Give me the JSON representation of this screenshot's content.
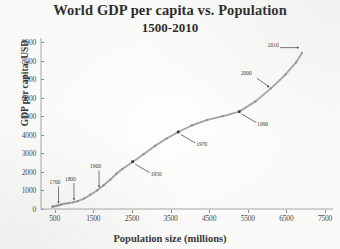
{
  "chart_data": {
    "type": "line",
    "title": "World GDP per capita vs. Population",
    "subtitle": "1500-2010",
    "xlabel": "Population size (millions)",
    "ylabel": "GDP per capita, USD",
    "xlim": [
      250,
      7500
    ],
    "ylim": [
      0,
      9000
    ],
    "xticks": [
      500,
      1500,
      2500,
      3500,
      4500,
      5500,
      6500,
      7500
    ],
    "yticks": [
      0,
      1000,
      2000,
      3000,
      4000,
      5000,
      6000,
      7000,
      8000,
      9000
    ],
    "grid": false,
    "legend": null,
    "marker": "filled-circle",
    "series": [
      {
        "name": "World GDP per capita",
        "points": [
          {
            "x": 440,
            "y": 120
          },
          {
            "x": 480,
            "y": 140
          },
          {
            "x": 520,
            "y": 160
          },
          {
            "x": 560,
            "y": 180
          },
          {
            "x": 600,
            "y": 200
          },
          {
            "x": 650,
            "y": 230
          },
          {
            "x": 700,
            "y": 260
          },
          {
            "x": 780,
            "y": 290
          },
          {
            "x": 870,
            "y": 320
          },
          {
            "x": 980,
            "y": 360
          },
          {
            "x": 1100,
            "y": 420
          },
          {
            "x": 1260,
            "y": 560
          },
          {
            "x": 1420,
            "y": 760
          },
          {
            "x": 1600,
            "y": 1000
          },
          {
            "x": 1770,
            "y": 1280
          },
          {
            "x": 1950,
            "y": 1600
          },
          {
            "x": 2100,
            "y": 1900
          },
          {
            "x": 2250,
            "y": 2150
          },
          {
            "x": 2530,
            "y": 2550
          },
          {
            "x": 2800,
            "y": 2950
          },
          {
            "x": 3100,
            "y": 3400
          },
          {
            "x": 3400,
            "y": 3800
          },
          {
            "x": 3700,
            "y": 4150
          },
          {
            "x": 4050,
            "y": 4500
          },
          {
            "x": 4450,
            "y": 4800
          },
          {
            "x": 4850,
            "y": 5000
          },
          {
            "x": 5280,
            "y": 5250
          },
          {
            "x": 5700,
            "y": 5800
          },
          {
            "x": 6100,
            "y": 6500
          },
          {
            "x": 6480,
            "y": 7250
          },
          {
            "x": 6750,
            "y": 7900
          },
          {
            "x": 6900,
            "y": 8400
          }
        ]
      }
    ],
    "annotations": [
      {
        "label": "1700",
        "x": 600,
        "y": 200,
        "style": "down-arrow"
      },
      {
        "label": "1800",
        "x": 1000,
        "y": 370,
        "style": "down-arrow"
      },
      {
        "label": "1900",
        "x": 1650,
        "y": 1060,
        "style": "down-arrow"
      },
      {
        "label": "1950",
        "x": 2520,
        "y": 2550,
        "style": "leader-right"
      },
      {
        "label": "1970",
        "x": 3700,
        "y": 4150,
        "style": "leader-right"
      },
      {
        "label": "1990",
        "x": 5280,
        "y": 5250,
        "style": "leader-right"
      },
      {
        "label": "2000",
        "x": 6100,
        "y": 6500,
        "style": "leader-left"
      },
      {
        "label": "2010",
        "x": 6900,
        "y": 8400,
        "style": "arrow-left"
      }
    ],
    "colors": {
      "line": "#9a9a9a",
      "marker": "#8c8c8c",
      "axis": "#8a8a8a",
      "text": "#2b2b2b",
      "background": "#fdfdfc"
    }
  }
}
